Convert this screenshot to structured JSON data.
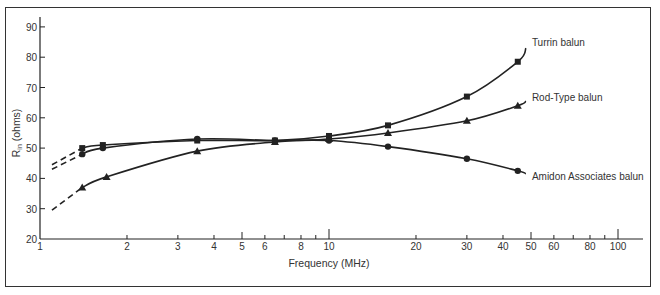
{
  "chart_data": {
    "type": "line",
    "title": "",
    "xlabel": "Frequency (MHz)",
    "ylabel": "R_in (ohms)",
    "ylabel_main": "R",
    "ylabel_sub": "in",
    "ylabel_rest": " (ohms)",
    "xscale": "log",
    "xlim": [
      1,
      100
    ],
    "ylim": [
      20,
      90
    ],
    "xticks": [
      1,
      2,
      3,
      4,
      5,
      6,
      8,
      10,
      20,
      30,
      40,
      50,
      60,
      80,
      100
    ],
    "yticks": [
      20,
      30,
      40,
      50,
      60,
      70,
      80,
      90
    ],
    "grid": false,
    "legend_position": "inline labels at right end of each curve",
    "series": [
      {
        "name": "Turrin balun",
        "marker": "square",
        "x": [
          1.4,
          1.65,
          3.5,
          6.5,
          10,
          16,
          30,
          45
        ],
        "y": [
          50,
          51,
          52.5,
          52.5,
          54,
          57.5,
          67,
          78.5
        ],
        "curve_end": [
          48,
          83
        ],
        "dashed_extension": [
          [
            1.1,
            44.5
          ],
          [
            1.4,
            50
          ]
        ]
      },
      {
        "name": "Rod-Type balun",
        "marker": "triangle",
        "x": [
          1.4,
          1.7,
          3.5,
          6.5,
          10,
          16,
          30,
          45
        ],
        "y": [
          37,
          40.5,
          49,
          52,
          53,
          55,
          59,
          64
        ],
        "curve_end": [
          48,
          65.5
        ],
        "dashed_extension": [
          [
            1.1,
            29.5
          ],
          [
            1.4,
            37
          ]
        ]
      },
      {
        "name": "Amidon Associates balun",
        "marker": "circle",
        "x": [
          1.4,
          1.65,
          3.5,
          6.5,
          10,
          16,
          30,
          45
        ],
        "y": [
          48,
          50,
          53,
          52.5,
          52.5,
          50.5,
          46.5,
          42.5
        ],
        "curve_end": [
          48,
          41.5
        ],
        "dashed_extension": [
          [
            1.1,
            43
          ],
          [
            1.4,
            48
          ]
        ]
      }
    ]
  }
}
